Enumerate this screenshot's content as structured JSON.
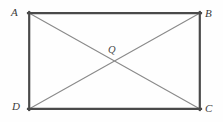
{
  "figure": {
    "kind": "rectangle-with-diagonals",
    "background_color": "#fefefe",
    "rectangle": {
      "name": "ABCD",
      "stroke_color": "#4a4a4a",
      "stroke_width": 2.2,
      "x": 29,
      "y": 13,
      "width": 171,
      "height": 96,
      "vertices": [
        {
          "id": "A",
          "label": "A",
          "position": "top-left",
          "x": 29,
          "y": 13
        },
        {
          "id": "B",
          "label": "B",
          "position": "top-right",
          "x": 200,
          "y": 13
        },
        {
          "id": "C",
          "label": "C",
          "position": "bottom-right",
          "x": 200,
          "y": 109
        },
        {
          "id": "D",
          "label": "D",
          "position": "bottom-left",
          "x": 29,
          "y": 109
        }
      ]
    },
    "diagonals": [
      {
        "id": "AC",
        "from": "A",
        "to": "C",
        "stroke_color": "#8a8a8a",
        "stroke_width": 1.1
      },
      {
        "id": "BD",
        "from": "B",
        "to": "D",
        "stroke_color": "#8a8a8a",
        "stroke_width": 1.1
      }
    ],
    "points": [
      {
        "id": "Q",
        "label": "Q",
        "x": 114.5,
        "y": 61,
        "description": "intersection of diagonals AC and BD"
      }
    ]
  }
}
